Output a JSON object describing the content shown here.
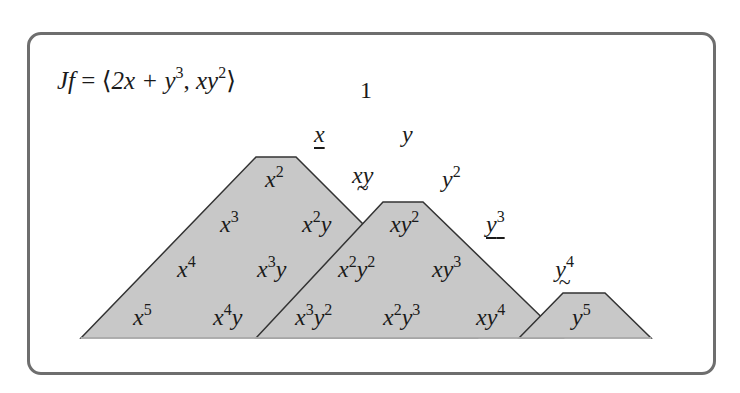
{
  "title_formula": {
    "lhs": "Jf",
    "eq": "=",
    "lbracket": "⟨",
    "term1_base": "2x + y",
    "term1_exp": "3",
    "sep": ",",
    "term2_base": "xy",
    "term2_exp": "2",
    "rbracket": "⟩"
  },
  "colors": {
    "fill": "#c8c8c8",
    "stroke": "#333333",
    "frame": "#6e6e6e"
  },
  "monomials": {
    "one": "1",
    "x": "x",
    "y": "y",
    "xy": "xy",
    "y2": {
      "base": "y",
      "exp": "2"
    },
    "x2": {
      "base": "x",
      "exp": "2"
    },
    "xy2": {
      "base": "xy",
      "exp": "2"
    },
    "y3": {
      "base": "y",
      "exp": "3"
    },
    "x3": {
      "base": "x",
      "exp": "3"
    },
    "x2y": {
      "b1": "x",
      "e1": "2",
      "b2": "y"
    },
    "x2y2": {
      "b1": "x",
      "e1": "2",
      "b2": "y",
      "e2": "2"
    },
    "xy3": {
      "base": "xy",
      "exp": "3"
    },
    "y4": {
      "base": "y",
      "exp": "4"
    },
    "x4": {
      "base": "x",
      "exp": "4"
    },
    "x3y": {
      "b1": "x",
      "e1": "3",
      "b2": "y"
    },
    "x5": {
      "base": "x",
      "exp": "5"
    },
    "x4y": {
      "b1": "x",
      "e1": "4",
      "b2": "y"
    },
    "x3y2": {
      "b1": "x",
      "e1": "3",
      "b2": "y",
      "e2": "2"
    },
    "x2y3": {
      "b1": "x",
      "e1": "2",
      "b2": "y",
      "e2": "3"
    },
    "xy4": {
      "base": "xy",
      "exp": "4"
    },
    "y5": {
      "base": "y",
      "exp": "5"
    }
  }
}
